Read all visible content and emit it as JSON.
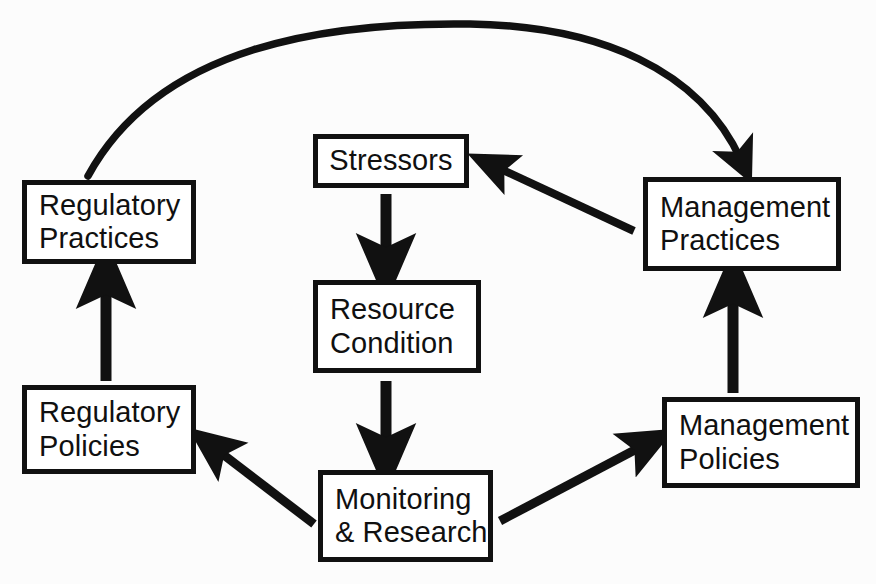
{
  "diagram": {
    "background_color": "#fcfcfc",
    "line_color": "#111111",
    "box_fill_color": "#ffffff",
    "nodes": [
      {
        "id": "regulatory-practices",
        "label": "Regulatory\nPractices"
      },
      {
        "id": "regulatory-policies",
        "label": "Regulatory\nPolicies"
      },
      {
        "id": "stressors",
        "label": "Stressors"
      },
      {
        "id": "resource-condition",
        "label": "Resource\nCondition"
      },
      {
        "id": "monitoring-research",
        "label": "Monitoring\n& Research"
      },
      {
        "id": "management-practices",
        "label": "Management\nPractices"
      },
      {
        "id": "management-policies",
        "label": "Management\nPolicies"
      }
    ],
    "edges": [
      {
        "id": "regulatory-practices-to-management-practices",
        "from": "Regulatory Practices",
        "to": "Management Practices",
        "style": "curved"
      },
      {
        "id": "management-practices-to-stressors",
        "from": "Management Practices",
        "to": "Stressors",
        "style": "straight-diagonal"
      },
      {
        "id": "stressors-to-resource-condition",
        "from": "Stressors",
        "to": "Resource Condition",
        "style": "straight-vertical"
      },
      {
        "id": "resource-condition-to-monitoring-research",
        "from": "Resource Condition",
        "to": "Monitoring & Research",
        "style": "straight-vertical"
      },
      {
        "id": "monitoring-research-to-regulatory-policies",
        "from": "Monitoring & Research",
        "to": "Regulatory Policies",
        "style": "straight-diagonal"
      },
      {
        "id": "monitoring-research-to-management-policies",
        "from": "Monitoring & Research",
        "to": "Management Policies",
        "style": "straight-diagonal"
      },
      {
        "id": "regulatory-policies-to-regulatory-practices",
        "from": "Regulatory Policies",
        "to": "Regulatory Practices",
        "style": "straight-vertical"
      },
      {
        "id": "management-policies-to-management-practices",
        "from": "Management Policies",
        "to": "Management Practices",
        "style": "straight-vertical"
      }
    ],
    "caption_fragment": ""
  }
}
